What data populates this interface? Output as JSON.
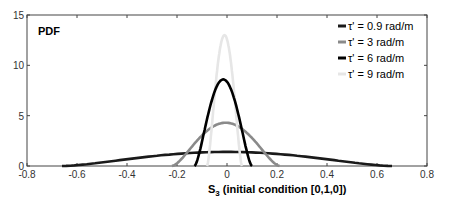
{
  "chart_data": {
    "type": "line",
    "title": "",
    "panel_label": "PDF",
    "xlabel": "S_3 (initial condition [0,1,0])",
    "xlabel_main": "S",
    "xlabel_sub": "3",
    "xlabel_rest": " (initial condition [0,1,0])",
    "ylabel": "",
    "xlim": [
      -0.8,
      0.8
    ],
    "ylim": [
      0,
      15
    ],
    "xticks": [
      -0.8,
      -0.6,
      -0.4,
      -0.2,
      0,
      0.2,
      0.4,
      0.6,
      0.8
    ],
    "xtick_labels": [
      "-0.8",
      "-0.6",
      "-0.4",
      "-0.2",
      "0",
      "0.2",
      "0.4",
      "0.6",
      "0.8"
    ],
    "yticks": [
      0,
      5,
      10,
      15
    ],
    "ytick_labels": [
      "0",
      "5",
      "10",
      "15"
    ],
    "grid": false,
    "legend_position": "upper right",
    "series": [
      {
        "name": "τ' = 0.9 rad/m",
        "color": "#1a1a1a",
        "peak": 1.4,
        "support": [
          -0.66,
          0.66
        ],
        "shape": "wide-bell"
      },
      {
        "name": "τ' = 3 rad/m",
        "color": "#8a8a8a",
        "peak": 4.3,
        "support": [
          -0.22,
          0.21
        ],
        "shape": "bell"
      },
      {
        "name": "τ' = 6 rad/m",
        "color": "#000000",
        "peak": 8.6,
        "support": [
          -0.13,
          0.1
        ],
        "shape": "narrow-bell"
      },
      {
        "name": "τ' = 9 rad/m",
        "color": "#e6e6e6",
        "peak": 13.0,
        "support": [
          -0.08,
          0.06
        ],
        "shape": "very-narrow-bell"
      }
    ]
  },
  "legend": {
    "items": [
      {
        "label": "τ' = 0.9 rad/m"
      },
      {
        "label": "τ' = 3 rad/m"
      },
      {
        "label": "τ' = 6 rad/m"
      },
      {
        "label": "τ' = 9 rad/m"
      }
    ]
  }
}
